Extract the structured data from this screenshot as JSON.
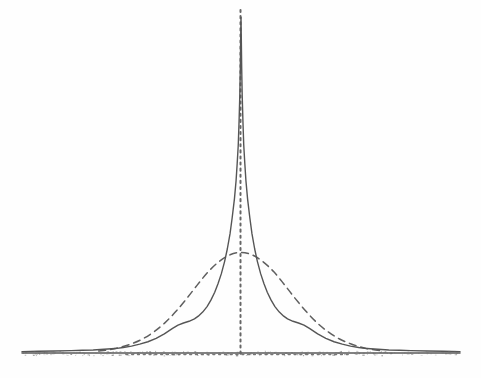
{
  "figure": {
    "kind": "scanned-figure",
    "background_color": "#fefefe",
    "ink_color": "#555555",
    "width": 481,
    "height": 378
  },
  "chart_data": {
    "type": "line",
    "title": "",
    "subtitle": "",
    "xlabel": "",
    "ylabel": "",
    "xlim": [
      -4,
      4
    ],
    "ylim": [
      0,
      1
    ],
    "grid": false,
    "legend_position": "none",
    "annotations": [],
    "tick_labels": {
      "x": [],
      "y": []
    },
    "reference_lines": [
      {
        "name": "center-vertical-dotted-line",
        "orientation": "vertical",
        "value": 0,
        "style": "dotted",
        "color": "#666666"
      },
      {
        "name": "baseline-horizontal-dotted-line",
        "orientation": "horizontal",
        "value": 0,
        "style": "dotted",
        "color": "#777777",
        "x_extent": [
          -2.3,
          2.3
        ]
      },
      {
        "name": "axis-baseline",
        "orientation": "horizontal",
        "value": 0,
        "style": "solid",
        "color": "#5a5a5a",
        "x_extent": [
          -4,
          4
        ]
      }
    ],
    "series": [
      {
        "name": "empirical-leptokurtic-density",
        "style": "solid",
        "color": "#555555",
        "x": [
          -4.0,
          -3.7,
          -3.4,
          -3.1,
          -2.9,
          -2.7,
          -2.5,
          -2.3,
          -2.15,
          -2.0,
          -1.85,
          -1.7,
          -1.55,
          -1.4,
          -1.25,
          -1.15,
          -1.05,
          -0.95,
          -0.85,
          -0.78,
          -0.7,
          -0.62,
          -0.55,
          -0.48,
          -0.42,
          -0.36,
          -0.3,
          -0.25,
          -0.2,
          -0.16,
          -0.12,
          -0.09,
          -0.07,
          -0.05,
          -0.035,
          -0.022,
          -0.012,
          -0.005,
          0.0,
          0.005,
          0.012,
          0.022,
          0.035,
          0.05,
          0.07,
          0.09,
          0.12,
          0.16,
          0.2,
          0.25,
          0.3,
          0.36,
          0.42,
          0.48,
          0.55,
          0.62,
          0.7,
          0.78,
          0.85,
          0.95,
          1.05,
          1.15,
          1.25,
          1.4,
          1.55,
          1.7,
          1.85,
          2.0,
          2.15,
          2.3,
          2.5,
          2.7,
          2.9,
          3.1,
          3.4,
          3.7,
          4.0
        ],
        "y": [
          0.004,
          0.005,
          0.006,
          0.007,
          0.008,
          0.009,
          0.011,
          0.013,
          0.016,
          0.02,
          0.026,
          0.033,
          0.043,
          0.056,
          0.072,
          0.082,
          0.088,
          0.093,
          0.1,
          0.108,
          0.12,
          0.136,
          0.155,
          0.178,
          0.203,
          0.232,
          0.268,
          0.305,
          0.35,
          0.398,
          0.452,
          0.505,
          0.555,
          0.61,
          0.68,
          0.755,
          0.84,
          0.93,
          0.985,
          0.93,
          0.84,
          0.755,
          0.68,
          0.61,
          0.555,
          0.505,
          0.452,
          0.398,
          0.35,
          0.305,
          0.268,
          0.232,
          0.203,
          0.178,
          0.155,
          0.136,
          0.12,
          0.108,
          0.1,
          0.093,
          0.088,
          0.082,
          0.072,
          0.056,
          0.043,
          0.033,
          0.026,
          0.02,
          0.016,
          0.013,
          0.011,
          0.009,
          0.008,
          0.007,
          0.006,
          0.005,
          0.004
        ]
      },
      {
        "name": "fitted-normal-density",
        "style": "dashed",
        "color": "#5f5f5f",
        "x": [
          -2.6,
          -2.4,
          -2.2,
          -2.0,
          -1.8,
          -1.6,
          -1.4,
          -1.2,
          -1.0,
          -0.8,
          -0.6,
          -0.4,
          -0.2,
          0.0,
          0.2,
          0.4,
          0.6,
          0.8,
          1.0,
          1.2,
          1.4,
          1.6,
          1.8,
          2.0,
          2.2,
          2.4,
          2.6
        ],
        "y": [
          0.006,
          0.01,
          0.017,
          0.027,
          0.041,
          0.061,
          0.087,
          0.12,
          0.158,
          0.199,
          0.238,
          0.268,
          0.288,
          0.295,
          0.288,
          0.268,
          0.238,
          0.199,
          0.158,
          0.12,
          0.087,
          0.061,
          0.041,
          0.027,
          0.017,
          0.01,
          0.006
        ]
      }
    ]
  }
}
